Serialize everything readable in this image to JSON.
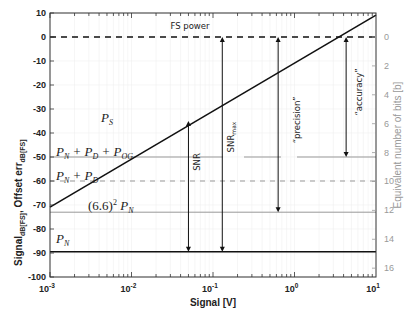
{
  "chart_data": {
    "type": "line",
    "title": "",
    "xlabel": "Signal [V]",
    "ylabel_main": "Signal",
    "ylabel_main_sub": "dB[FS]",
    "ylabel_second": "Offset err",
    "ylabel_second_sub": "dB[FS]",
    "y2label": "Equivalent number of bits [b]",
    "xscale": "log",
    "xlim": [
      0.001,
      10
    ],
    "ylim": [
      -100,
      10
    ],
    "y2lim_top_to_bottom": [
      0,
      16
    ],
    "grid": true,
    "x_ticks": [
      {
        "base": "10",
        "exp": "-3",
        "value": 0.001
      },
      {
        "base": "10",
        "exp": "-2",
        "value": 0.01
      },
      {
        "base": "10",
        "exp": "-1",
        "value": 0.1
      },
      {
        "base": "10",
        "exp": "0",
        "value": 1
      },
      {
        "base": "10",
        "exp": "1",
        "value": 10
      }
    ],
    "y_ticks": [
      "10",
      "0",
      "-10",
      "-20",
      "-30",
      "-40",
      "-50",
      "-60",
      "-70",
      "-80",
      "-90",
      "-100"
    ],
    "y2_ticks": [
      "0",
      "2",
      "4",
      "6",
      "8",
      "10",
      "12",
      "14",
      "16"
    ],
    "series": [
      {
        "name": "P_S",
        "style": "solid-black",
        "x": [
          0.001,
          10
        ],
        "y": [
          -70.9,
          9.1
        ]
      },
      {
        "name": "FS power",
        "style": "dashed-black",
        "y_const": 0
      },
      {
        "name": "P_N + P_D + P_OG",
        "style": "solid-gray",
        "y_const": -50
      },
      {
        "name": "P_N + P_D",
        "style": "dashed-gray",
        "y_const": -60
      },
      {
        "name": "(6.6)^2 P_N",
        "style": "solid-gray",
        "y_const": -73
      },
      {
        "name": "P_N",
        "style": "solid-black",
        "y_const": -89.5
      }
    ],
    "annotations": [
      {
        "label": "FS power",
        "x": 0.1,
        "y": 4
      },
      {
        "label": "SNR",
        "type": "double-arrow",
        "x": 0.05,
        "y_from": -35,
        "y_to": -89.5
      },
      {
        "label": "SNR_max",
        "type": "double-arrow",
        "x": 0.13,
        "y_from": 0,
        "y_to": -89.5
      },
      {
        "label": "\"precision\"",
        "type": "double-arrow",
        "x": 0.63,
        "y_from": 0,
        "y_to": -73
      },
      {
        "label": "\"accuracy\"",
        "type": "double-arrow",
        "x": 4.3,
        "y_from": 0,
        "y_to": -50
      }
    ]
  },
  "labels": {
    "fs_power": "FS power",
    "ps_main": "P",
    "ps_sub": "S",
    "snr": "SNR",
    "snrmax_main": "SNR",
    "snrmax_sub": "max",
    "precision": "“precision”",
    "accuracy": "“accuracy”",
    "pn_pd_pog": "P_N + P_D + P_OG",
    "pn_pd": "P_N + P_D",
    "pn66": "(6.6)² P_N",
    "pn": "P_N",
    "xlabel": "Signal [V]",
    "ylabel_signal": "Signal",
    "ylabel_signal_sub": "dB[FS]",
    "ylabel_offset": "Offset err",
    "ylabel_offset_sub": "dB[FS]",
    "y2label": "Equivalent number of bits [b]"
  }
}
